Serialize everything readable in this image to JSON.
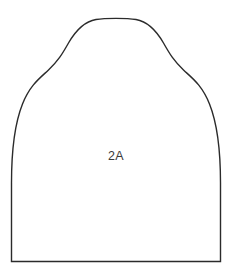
{
  "document": {
    "type": "sewing-pattern-piece",
    "background_color": "#ffffff"
  },
  "piece": {
    "label": "2A",
    "label_x": 116,
    "label_y": 160,
    "outline_color": "#2b2b2b",
    "fill_color": "#ffffff",
    "stroke_width": 1.4,
    "outline_path": "M 11.5 261.5 L 11.5 183 C 11.5 152 14.5 124 22.5 104 C 30 85 40 78 48.5 70 C 58 61 62 54.5 68.5 43 C 76 30 84 21.5 96 19.5 C 105 18 127 18 136 19.5 C 148 21.5 156 30 163.5 43 C 170 54.5 174 61 183.5 70 C 192 78 202 85 209.5 104 C 217.5 124 220.5 152 220.5 183 L 220.5 261.5 Z",
    "anchors": {
      "bottom_left": [
        11.5,
        261.5
      ],
      "bottom_right": [
        220.5,
        261.5
      ],
      "apex_left": [
        96,
        19.5
      ],
      "apex_right": [
        136,
        19.5
      ],
      "left_inflection": [
        48.5,
        70
      ],
      "right_inflection": [
        183.5,
        70
      ]
    }
  }
}
